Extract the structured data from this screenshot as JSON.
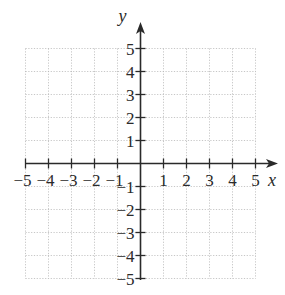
{
  "chart_data": {
    "type": "scatter",
    "title": "",
    "xlabel": "x",
    "ylabel": "y",
    "xlim": [
      -5,
      5
    ],
    "ylim": [
      -5,
      5
    ],
    "grid": true,
    "grid_style": "dotted",
    "x_ticks": [
      -5,
      -4,
      -3,
      -2,
      -1,
      1,
      2,
      3,
      4,
      5
    ],
    "y_ticks": [
      -5,
      -4,
      -3,
      -2,
      -1,
      1,
      2,
      3,
      4,
      5
    ],
    "x_tick_labels": [
      "−5",
      "−4",
      "−3",
      "−2",
      "−1",
      "1",
      "2",
      "3",
      "4",
      "5"
    ],
    "y_tick_labels": [
      "−5",
      "−4",
      "−3",
      "−2",
      "−1",
      "1",
      "2",
      "3",
      "4",
      "5"
    ],
    "series": [],
    "legend": null
  },
  "colors": {
    "axis": "#2a2a2a",
    "grid": "#b8b8b8",
    "background": "#ffffff"
  },
  "layout": {
    "origin_px": [
      140.5,
      163.5
    ],
    "unit_px": 23,
    "grid_min": -5,
    "grid_max": 5,
    "x_axis_end_px": 278,
    "y_axis_top_px": 22,
    "y_axis_bottom_px": 280,
    "x_axis_left_px": 26
  }
}
